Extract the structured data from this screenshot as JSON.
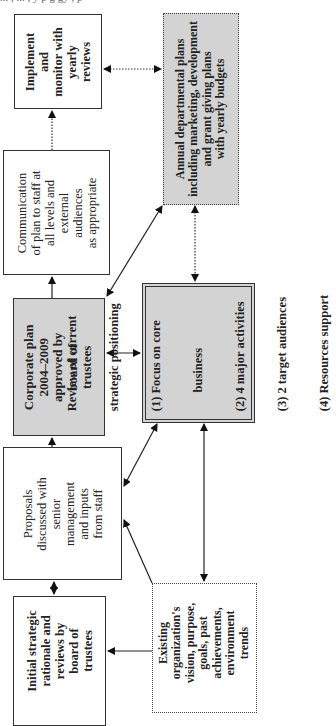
{
  "caption_fragment": "... , ... , y  p     g   gy ,     p",
  "diagram": {
    "orientation": "rotated -90deg",
    "nodes": [
      {
        "id": "implement",
        "lines": [
          "Implement",
          "and",
          "monitor with",
          "yearly",
          "reviews"
        ],
        "style": "solid-white"
      },
      {
        "id": "communication",
        "lines": [
          "Communication",
          "of plan to staff at",
          "all levels and",
          "external",
          "audiences",
          "as appropriate"
        ],
        "style": "solid-white"
      },
      {
        "id": "corporate_plan",
        "lines": [
          "Corporate plan",
          "2004–2009",
          "approved by",
          "board of",
          "trustees"
        ],
        "style": "solid-gray-bold"
      },
      {
        "id": "proposals",
        "lines": [
          "Proposals",
          "discussed with",
          "senior",
          "management",
          "and inputs",
          "from staff"
        ],
        "style": "solid-white"
      },
      {
        "id": "initial",
        "lines": [
          "Initial strategic",
          "rationale and",
          "reviews by",
          "board of",
          "trustees"
        ],
        "style": "solid-white-bold"
      },
      {
        "id": "annual",
        "lines": [
          "Annual departmental plans",
          "including marketing, development",
          "and grant giving plans",
          "with yearly budgets"
        ],
        "style": "dotted-gray-bold"
      },
      {
        "id": "review",
        "lines": [
          "Review of current",
          "strategic positioning",
          "(1) Focus on core",
          "      business",
          "(2) 4 major activities",
          "(3) 2 target audiences",
          "(4) Resources support"
        ],
        "style": "double-gray-bold"
      },
      {
        "id": "existing",
        "lines": [
          "Existing",
          "organization's",
          "vision, purpose,",
          "goals, past",
          "achievements,",
          "environment",
          "trends"
        ],
        "style": "dotted-white-bold"
      }
    ],
    "edges": [
      {
        "from": "communication",
        "to": "implement",
        "style": "dotted",
        "arrow": "single"
      },
      {
        "from": "implement",
        "to": "annual",
        "style": "dotted",
        "arrow": "double"
      },
      {
        "from": "corporate_plan",
        "to": "communication",
        "style": "solid",
        "arrow": "single"
      },
      {
        "from": "corporate_plan",
        "to": "annual",
        "style": "solid",
        "arrow": "double"
      },
      {
        "from": "corporate_plan",
        "to": "review",
        "style": "solid",
        "arrow": "double"
      },
      {
        "from": "annual",
        "to": "review",
        "style": "dotted",
        "arrow": "double"
      },
      {
        "from": "proposals",
        "to": "corporate_plan",
        "style": "solid",
        "arrow": "single"
      },
      {
        "from": "proposals",
        "to": "review",
        "style": "solid",
        "arrow": "double"
      },
      {
        "from": "existing",
        "to": "proposals",
        "style": "solid",
        "arrow": "single"
      },
      {
        "from": "existing",
        "to": "review",
        "style": "solid",
        "arrow": "double"
      },
      {
        "from": "initial",
        "to": "proposals",
        "style": "solid",
        "arrow": "double"
      },
      {
        "from": "existing",
        "to": "initial",
        "style": "solid",
        "arrow": "single"
      }
    ]
  },
  "colors": {
    "gray_fill": "#d3d3d3",
    "line": "#222222",
    "background": "#ffffff"
  }
}
